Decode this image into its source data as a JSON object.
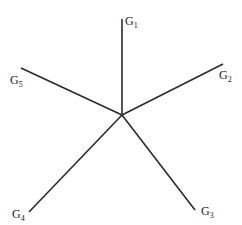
{
  "diagram": {
    "center": {
      "x": 122,
      "y": 115
    },
    "stroke_color": "#2a2a2a",
    "branches": [
      {
        "id": "G1",
        "letter": "G",
        "sub": "1",
        "end": {
          "x": 122,
          "y": 19
        },
        "label_pos": {
          "x": 125,
          "y": 25
        }
      },
      {
        "id": "G2",
        "letter": "G",
        "sub": "2",
        "end": {
          "x": 223,
          "y": 64
        },
        "label_pos": {
          "x": 219,
          "y": 79
        }
      },
      {
        "id": "G3",
        "letter": "G",
        "sub": "3",
        "end": {
          "x": 195,
          "y": 210
        },
        "label_pos": {
          "x": 201,
          "y": 215
        }
      },
      {
        "id": "G4",
        "letter": "G",
        "sub": "4",
        "end": {
          "x": 29,
          "y": 212
        },
        "label_pos": {
          "x": 12,
          "y": 218
        }
      },
      {
        "id": "G5",
        "letter": "G",
        "sub": "5",
        "end": {
          "x": 21,
          "y": 68
        },
        "label_pos": {
          "x": 10,
          "y": 84
        }
      }
    ]
  }
}
